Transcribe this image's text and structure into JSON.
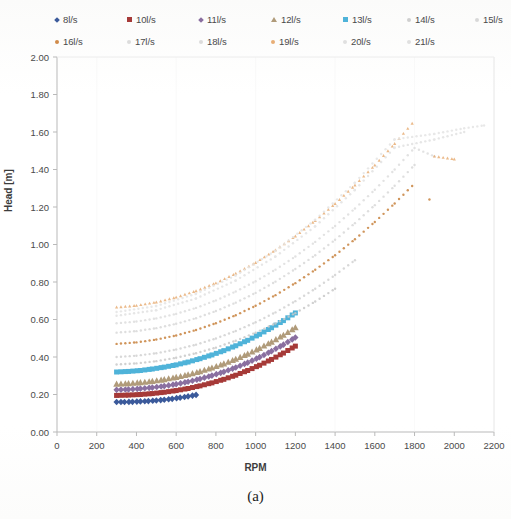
{
  "caption": "(a)",
  "legend": {
    "rows": [
      [
        {
          "label": "8l/s",
          "color": "#3b5a9b",
          "shape": "diamond"
        },
        {
          "label": "10l/s",
          "color": "#a63a38",
          "shape": "square"
        },
        {
          "label": "11l/s",
          "color": "#8a6fa0",
          "shape": "diamond"
        },
        {
          "label": "12l/s",
          "color": "#b09b7a",
          "shape": "triangle"
        },
        {
          "label": "13l/s",
          "color": "#4fb3d9",
          "shape": "square"
        },
        {
          "label": "14l/s",
          "color": "#cfcfcf",
          "shape": "dot"
        },
        {
          "label": "15l/s",
          "color": "#d8d8d8",
          "shape": "dot"
        }
      ],
      [
        {
          "label": "16l/s",
          "color": "#d08b4a",
          "shape": "dot"
        },
        {
          "label": "17l/s",
          "color": "#dcdcdc",
          "shape": "dot"
        },
        {
          "label": "18l/s",
          "color": "#dcdcdc",
          "shape": "dot"
        },
        {
          "label": "19l/s",
          "color": "#e8ae76",
          "shape": "dot"
        },
        {
          "label": "20l/s",
          "color": "#e0e0e0",
          "shape": "dot"
        },
        {
          "label": "21l/s",
          "color": "#e0e0e0",
          "shape": "dot"
        }
      ]
    ]
  },
  "chart_data": {
    "type": "scatter",
    "title": "",
    "xlabel": "RPM",
    "ylabel": "Head [m]",
    "xlim": [
      0,
      2200
    ],
    "ylim": [
      0.0,
      2.0
    ],
    "xticks": [
      0,
      200,
      400,
      600,
      800,
      1000,
      1200,
      1400,
      1600,
      1800,
      2000,
      2200
    ],
    "yticks": [
      "0.00",
      "0.20",
      "0.40",
      "0.60",
      "0.80",
      "1.00",
      "1.20",
      "1.40",
      "1.60",
      "1.80",
      "2.00"
    ],
    "ytick_values": [
      0.0,
      0.2,
      0.4,
      0.6,
      0.8,
      1.0,
      1.2,
      1.4,
      1.6,
      1.8,
      2.0
    ],
    "grid": false,
    "legend_position": "top",
    "series": [
      {
        "name": "8l/s",
        "color": "#3b5a9b",
        "marker": "diamond",
        "x": [
          300,
          340,
          380,
          420,
          460,
          500,
          540,
          580,
          620,
          660,
          700
        ],
        "y": [
          0.16,
          0.16,
          0.161,
          0.163,
          0.165,
          0.168,
          0.172,
          0.177,
          0.183,
          0.19,
          0.198
        ]
      },
      {
        "name": "10l/s",
        "color": "#a63a38",
        "marker": "square",
        "x": [
          300,
          360,
          420,
          480,
          540,
          600,
          660,
          720,
          780,
          840,
          900,
          960,
          1020,
          1080,
          1140,
          1200
        ],
        "y": [
          0.195,
          0.197,
          0.2,
          0.205,
          0.212,
          0.221,
          0.232,
          0.246,
          0.262,
          0.281,
          0.303,
          0.328,
          0.356,
          0.387,
          0.421,
          0.458
        ]
      },
      {
        "name": "11l/s",
        "color": "#8a6fa0",
        "marker": "diamond",
        "x": [
          300,
          360,
          420,
          480,
          540,
          600,
          660,
          720,
          780,
          840,
          900,
          960,
          1020,
          1080,
          1140,
          1200
        ],
        "y": [
          0.225,
          0.227,
          0.231,
          0.237,
          0.245,
          0.255,
          0.268,
          0.283,
          0.301,
          0.321,
          0.344,
          0.37,
          0.399,
          0.431,
          0.466,
          0.504
        ]
      },
      {
        "name": "12l/s",
        "color": "#b09b7a",
        "marker": "triangle",
        "x": [
          300,
          360,
          420,
          480,
          540,
          600,
          660,
          720,
          780,
          840,
          900,
          960,
          1020,
          1080,
          1140,
          1200
        ],
        "y": [
          0.255,
          0.258,
          0.263,
          0.27,
          0.279,
          0.291,
          0.305,
          0.322,
          0.341,
          0.363,
          0.388,
          0.415,
          0.446,
          0.479,
          0.516,
          0.556
        ]
      },
      {
        "name": "13l/s",
        "color": "#4fb3d9",
        "marker": "square",
        "x": [
          300,
          360,
          420,
          480,
          540,
          600,
          660,
          720,
          780,
          840,
          900,
          960,
          1020,
          1080,
          1140,
          1200
        ],
        "y": [
          0.32,
          0.323,
          0.328,
          0.336,
          0.346,
          0.358,
          0.373,
          0.391,
          0.411,
          0.434,
          0.46,
          0.489,
          0.521,
          0.556,
          0.594,
          0.635
        ]
      },
      {
        "name": "14l/s",
        "color": "#c9c9c9",
        "marker": "dot",
        "x": [
          300,
          400,
          500,
          600,
          700,
          800,
          900,
          1000,
          1100,
          1200,
          1300,
          1400
        ],
        "y": [
          0.36,
          0.366,
          0.378,
          0.396,
          0.42,
          0.45,
          0.487,
          0.53,
          0.579,
          0.634,
          0.696,
          0.764
        ]
      },
      {
        "name": "15l/s",
        "color": "#d2d2d2",
        "marker": "dot",
        "x": [
          300,
          400,
          500,
          600,
          700,
          800,
          900,
          1000,
          1100,
          1200,
          1300,
          1400,
          1500
        ],
        "y": [
          0.4,
          0.407,
          0.42,
          0.44,
          0.466,
          0.499,
          0.539,
          0.585,
          0.638,
          0.698,
          0.764,
          0.837,
          0.916
        ]
      },
      {
        "name": "16l/s",
        "color": "#c8833f",
        "marker": "dot",
        "x": [
          300,
          400,
          500,
          600,
          700,
          800,
          900,
          1000,
          1100,
          1200,
          1300,
          1400,
          1500,
          1600,
          1700,
          1800,
          1875
        ],
        "y": [
          0.47,
          0.478,
          0.493,
          0.515,
          0.544,
          0.58,
          0.623,
          0.673,
          0.73,
          0.794,
          0.865,
          0.943,
          1.028,
          1.12,
          1.219,
          1.325,
          1.24
        ]
      },
      {
        "name": "17l/s",
        "color": "#d9d9d9",
        "marker": "dot",
        "x": [
          300,
          400,
          500,
          600,
          700,
          800,
          900,
          1000,
          1100,
          1200,
          1300,
          1400,
          1500,
          1600,
          1700,
          1800
        ],
        "y": [
          0.53,
          0.538,
          0.554,
          0.577,
          0.607,
          0.645,
          0.69,
          0.742,
          0.802,
          0.869,
          0.943,
          1.025,
          1.114,
          1.21,
          1.313,
          1.424
        ]
      },
      {
        "name": "18l/s",
        "color": "#dedede",
        "marker": "dot",
        "x": [
          300,
          400,
          500,
          600,
          700,
          800,
          900,
          1000,
          1100,
          1200,
          1300,
          1400,
          1500,
          1600,
          1700,
          1800,
          1900
        ],
        "y": [
          0.58,
          0.589,
          0.606,
          0.63,
          0.662,
          0.702,
          0.749,
          0.804,
          0.866,
          0.936,
          1.014,
          1.099,
          1.192,
          1.292,
          1.4,
          1.515,
          1.47
        ]
      },
      {
        "name": "19l/s",
        "color": "#e8ae76",
        "marker": "triangle",
        "x": [
          300,
          400,
          500,
          600,
          700,
          800,
          900,
          1000,
          1100,
          1200,
          1300,
          1400,
          1500,
          1600,
          1700,
          1800,
          1900,
          2000
        ],
        "y": [
          0.665,
          0.674,
          0.692,
          0.718,
          0.752,
          0.794,
          0.845,
          0.903,
          0.97,
          1.044,
          1.127,
          1.217,
          1.316,
          1.423,
          1.537,
          1.66,
          1.47,
          1.455
        ]
      },
      {
        "name": "20l/s",
        "color": "#e2e2e2",
        "marker": "dot",
        "x": [
          300,
          500,
          700,
          900,
          1100,
          1300,
          1500,
          1700,
          1900,
          2050
        ],
        "y": [
          0.62,
          0.65,
          0.712,
          0.808,
          0.936,
          1.097,
          1.291,
          1.517,
          1.56,
          1.6
        ]
      },
      {
        "name": "21l/s",
        "color": "#e5e5e5",
        "marker": "dot",
        "x": [
          300,
          500,
          700,
          900,
          1100,
          1300,
          1500,
          1700,
          1900,
          2050,
          2150
        ],
        "y": [
          0.64,
          0.672,
          0.737,
          0.835,
          0.967,
          1.132,
          1.33,
          1.561,
          1.59,
          1.62,
          1.635
        ]
      }
    ]
  }
}
